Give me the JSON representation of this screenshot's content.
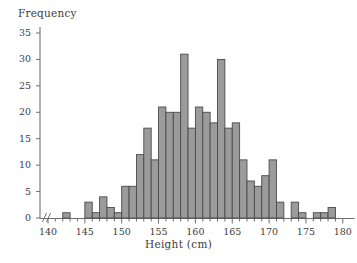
{
  "chart_data": {
    "type": "bar",
    "title": "",
    "subtitle": "",
    "xlabel": "Height (cm)",
    "ylabel": "Frequency",
    "xlim": [
      139,
      180
    ],
    "ylim": [
      0,
      36
    ],
    "grid": false,
    "legend": null,
    "axis_break_x": true,
    "bin_width": 1,
    "x_tick_step": 1,
    "x_label_step": 5,
    "y_tick_step": 5,
    "bar_fill": "#9b9b9b",
    "bar_stroke": "#4a4a4a",
    "axis_color": "#6f6f6f",
    "xticklabels": [
      "140",
      "145",
      "150",
      "155",
      "160",
      "165",
      "170",
      "175",
      "180"
    ],
    "xticklabel_values": [
      140,
      145,
      150,
      155,
      160,
      165,
      170,
      175,
      180
    ],
    "yticklabels": [
      "0",
      "5",
      "10",
      "15",
      "20",
      "25",
      "30",
      "35"
    ],
    "yticklabel_values": [
      0,
      5,
      10,
      15,
      20,
      25,
      30,
      35
    ],
    "bins": [
      {
        "start": 140,
        "end": 141,
        "value": 0
      },
      {
        "start": 141,
        "end": 142,
        "value": 0
      },
      {
        "start": 142,
        "end": 143,
        "value": 1
      },
      {
        "start": 143,
        "end": 144,
        "value": 0
      },
      {
        "start": 144,
        "end": 145,
        "value": 0
      },
      {
        "start": 145,
        "end": 146,
        "value": 3
      },
      {
        "start": 146,
        "end": 147,
        "value": 1
      },
      {
        "start": 147,
        "end": 148,
        "value": 4
      },
      {
        "start": 148,
        "end": 149,
        "value": 2
      },
      {
        "start": 149,
        "end": 150,
        "value": 1
      },
      {
        "start": 150,
        "end": 151,
        "value": 6
      },
      {
        "start": 151,
        "end": 152,
        "value": 6
      },
      {
        "start": 152,
        "end": 153,
        "value": 12
      },
      {
        "start": 153,
        "end": 154,
        "value": 17
      },
      {
        "start": 154,
        "end": 155,
        "value": 11
      },
      {
        "start": 155,
        "end": 156,
        "value": 21
      },
      {
        "start": 156,
        "end": 157,
        "value": 20
      },
      {
        "start": 157,
        "end": 158,
        "value": 20
      },
      {
        "start": 158,
        "end": 159,
        "value": 31
      },
      {
        "start": 159,
        "end": 160,
        "value": 17
      },
      {
        "start": 160,
        "end": 161,
        "value": 21
      },
      {
        "start": 161,
        "end": 162,
        "value": 20
      },
      {
        "start": 162,
        "end": 163,
        "value": 18
      },
      {
        "start": 163,
        "end": 164,
        "value": 30
      },
      {
        "start": 164,
        "end": 165,
        "value": 17
      },
      {
        "start": 165,
        "end": 166,
        "value": 18
      },
      {
        "start": 166,
        "end": 167,
        "value": 11
      },
      {
        "start": 167,
        "end": 168,
        "value": 7
      },
      {
        "start": 168,
        "end": 169,
        "value": 6
      },
      {
        "start": 169,
        "end": 170,
        "value": 8
      },
      {
        "start": 170,
        "end": 171,
        "value": 11
      },
      {
        "start": 171,
        "end": 172,
        "value": 3
      },
      {
        "start": 172,
        "end": 173,
        "value": 0
      },
      {
        "start": 173,
        "end": 174,
        "value": 3
      },
      {
        "start": 174,
        "end": 175,
        "value": 1
      },
      {
        "start": 175,
        "end": 176,
        "value": 0
      },
      {
        "start": 176,
        "end": 177,
        "value": 1
      },
      {
        "start": 177,
        "end": 178,
        "value": 1
      },
      {
        "start": 178,
        "end": 179,
        "value": 2
      },
      {
        "start": 179,
        "end": 180,
        "value": 0
      }
    ]
  }
}
